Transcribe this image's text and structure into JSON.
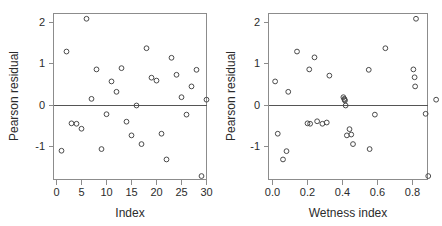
{
  "figure": {
    "background": "#ffffff",
    "point_color": "#4a4a4a",
    "axis_color": "#8c8c8c",
    "zeroline_color": "#555555"
  },
  "chart_data": [
    {
      "type": "scatter",
      "title": "",
      "xlabel": "Index",
      "ylabel": "Pearson residual",
      "xlim": [
        0,
        31
      ],
      "ylim": [
        -1.85,
        2.3
      ],
      "xticks": [
        0,
        5,
        10,
        15,
        20,
        25,
        30
      ],
      "xticklabels": [
        "0",
        "5",
        "10",
        "15",
        "20",
        "25",
        "30"
      ],
      "yticks": [
        -1,
        0,
        1,
        2
      ],
      "yticklabels": [
        "-1",
        "0",
        "1",
        "2"
      ],
      "grid": false,
      "legend": false,
      "reference_line_y": 0,
      "marker": "open-circle",
      "x": [
        1,
        2,
        3,
        4,
        5,
        6,
        7,
        8,
        9,
        10,
        11,
        12,
        13,
        14,
        15,
        16,
        17,
        18,
        19,
        20,
        21,
        22,
        23,
        24,
        25,
        26,
        27,
        28,
        29,
        30
      ],
      "y": [
        -1.09,
        1.3,
        -0.43,
        -0.44,
        -0.56,
        2.09,
        0.16,
        0.87,
        -1.05,
        -0.21,
        0.58,
        0.33,
        0.9,
        -0.39,
        -0.72,
        0.0,
        -0.93,
        1.38,
        0.67,
        0.6,
        -0.68,
        -1.3,
        1.15,
        0.74,
        0.2,
        -0.22,
        0.46,
        0.86,
        -1.7,
        0.14
      ]
    },
    {
      "type": "scatter",
      "title": "",
      "xlabel": "Wetness index",
      "ylabel": "Pearson residual",
      "xlim": [
        -0.02,
        0.97
      ],
      "ylim": [
        -1.85,
        2.3
      ],
      "xticks": [
        0.0,
        0.2,
        0.4,
        0.6,
        0.8
      ],
      "xticklabels": [
        "0.0",
        "0.2",
        "0.4",
        "0.6",
        "0.8"
      ],
      "yticks": [
        -1,
        0,
        1,
        2
      ],
      "yticklabels": [
        "-1",
        "0",
        "1",
        "2"
      ],
      "grid": false,
      "legend": false,
      "reference_line_y": 0,
      "marker": "open-circle",
      "x": [
        0.015,
        0.03,
        0.06,
        0.08,
        0.09,
        0.14,
        0.2,
        0.21,
        0.215,
        0.24,
        0.255,
        0.285,
        0.31,
        0.325,
        0.405,
        0.41,
        0.412,
        0.414,
        0.418,
        0.425,
        0.44,
        0.45,
        0.46,
        0.55,
        0.555,
        0.585,
        0.645,
        0.805,
        0.812,
        0.815,
        0.82,
        0.875,
        0.89,
        0.935
      ],
      "y": [
        0.58,
        -0.68,
        -1.3,
        -1.1,
        0.33,
        1.3,
        -0.43,
        0.87,
        -0.44,
        1.16,
        -0.38,
        -0.44,
        -0.41,
        0.72,
        0.2,
        0.16,
        0.14,
        0.12,
        0.0,
        -0.72,
        -0.57,
        -0.7,
        -0.93,
        0.86,
        -1.05,
        -0.22,
        1.38,
        0.87,
        0.68,
        0.46,
        2.09,
        -0.2,
        -1.7,
        0.14
      ]
    }
  ]
}
